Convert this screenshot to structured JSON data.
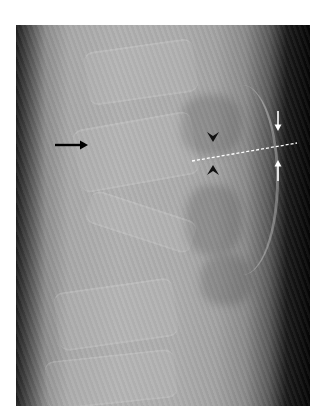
{
  "image": {
    "type": "lateral-spine-radiograph",
    "frame": {
      "x": 16,
      "y": 25,
      "width": 294,
      "height": 381
    }
  },
  "annotations": {
    "black_arrow": {
      "icon": "right-arrow-icon",
      "color": "#000000",
      "x1": 55,
      "y1": 145,
      "x2": 87,
      "y2": 145
    },
    "arrowhead_top": {
      "icon": "down-arrowhead-icon",
      "color": "#000000",
      "x": 213,
      "y": 137
    },
    "arrowhead_bottom": {
      "icon": "up-arrowhead-icon",
      "color": "#000000",
      "x": 213,
      "y": 170
    },
    "white_arrow_down": {
      "icon": "down-arrow-icon",
      "color": "#ffffff",
      "x": 278,
      "y1": 111,
      "y2": 130
    },
    "white_arrow_up": {
      "icon": "up-arrow-icon",
      "color": "#ffffff",
      "x": 278,
      "y1": 181,
      "y2": 160
    },
    "dashed_line": {
      "color": "#ffffff",
      "x1": 192,
      "y1": 161,
      "x2": 297,
      "y2": 143
    }
  }
}
